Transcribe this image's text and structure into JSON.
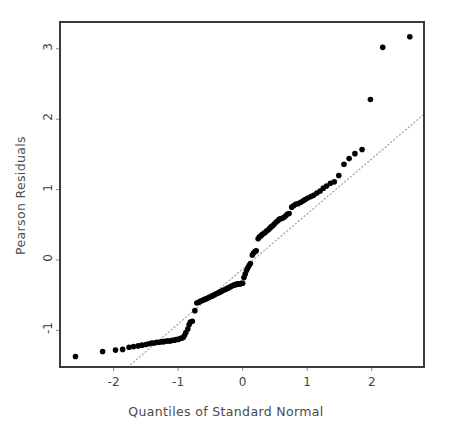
{
  "chart_data": {
    "type": "scatter",
    "title": "",
    "xlabel": "Quantiles of Standard Normal",
    "ylabel": "Pearson Residuals",
    "xlim": [
      -2.83,
      2.81
    ],
    "ylim": [
      -1.52,
      3.38
    ],
    "xticks": [
      -2,
      -1,
      0,
      1,
      2
    ],
    "xticklabels": [
      "-2",
      "-1",
      "0",
      "1",
      "2"
    ],
    "yticks": [
      -1,
      0,
      1,
      2,
      3
    ],
    "yticklabels": [
      "-1",
      "0",
      "1",
      "2",
      "3"
    ],
    "grid": false,
    "legend": null,
    "marker": {
      "shape": "circle",
      "color": "#000000",
      "size_px": 5.6
    },
    "reference_line": {
      "style": "dotted",
      "color": "#9a9a9a",
      "x": [
        -1.78,
        2.81
      ],
      "y": [
        -1.52,
        2.07
      ],
      "comment": "qq reference line through first and third quartiles"
    },
    "frame": {
      "color": "#3a3a3a",
      "width_px": 2
    },
    "n_points": 119,
    "points": [
      [
        -2.59,
        -1.37
      ],
      [
        -2.17,
        -1.3
      ],
      [
        -1.97,
        -1.28
      ],
      [
        -1.86,
        -1.27
      ],
      [
        -1.76,
        -1.24
      ],
      [
        -1.69,
        -1.23
      ],
      [
        -1.62,
        -1.22
      ],
      [
        -1.56,
        -1.21
      ],
      [
        -1.5,
        -1.2
      ],
      [
        -1.45,
        -1.19
      ],
      [
        -1.41,
        -1.18
      ],
      [
        -1.37,
        -1.18
      ],
      [
        -1.33,
        -1.17
      ],
      [
        -1.29,
        -1.17
      ],
      [
        -1.25,
        -1.16
      ],
      [
        -1.22,
        -1.16
      ],
      [
        -1.18,
        -1.15
      ],
      [
        -1.15,
        -1.15
      ],
      [
        -1.12,
        -1.15
      ],
      [
        -1.09,
        -1.14
      ],
      [
        -1.06,
        -1.14
      ],
      [
        -1.03,
        -1.13
      ],
      [
        -1.0,
        -1.13
      ],
      [
        -0.98,
        -1.12
      ],
      [
        -0.95,
        -1.11
      ],
      [
        -0.92,
        -1.1
      ],
      [
        -0.9,
        -1.07
      ],
      [
        -0.88,
        -1.03
      ],
      [
        -0.85,
        -0.98
      ],
      [
        -0.83,
        -0.92
      ],
      [
        -0.81,
        -0.88
      ],
      [
        -0.78,
        -0.87
      ],
      [
        -0.74,
        -0.72
      ],
      [
        -0.71,
        -0.61
      ],
      [
        -0.68,
        -0.6
      ],
      [
        -0.66,
        -0.59
      ],
      [
        -0.64,
        -0.58
      ],
      [
        -0.61,
        -0.57
      ],
      [
        -0.59,
        -0.56
      ],
      [
        -0.56,
        -0.55
      ],
      [
        -0.54,
        -0.54
      ],
      [
        -0.52,
        -0.53
      ],
      [
        -0.49,
        -0.52
      ],
      [
        -0.47,
        -0.51
      ],
      [
        -0.45,
        -0.5
      ],
      [
        -0.43,
        -0.49
      ],
      [
        -0.41,
        -0.48
      ],
      [
        -0.38,
        -0.47
      ],
      [
        -0.36,
        -0.46
      ],
      [
        -0.34,
        -0.45
      ],
      [
        -0.32,
        -0.44
      ],
      [
        -0.3,
        -0.43
      ],
      [
        -0.27,
        -0.42
      ],
      [
        -0.25,
        -0.41
      ],
      [
        -0.23,
        -0.4
      ],
      [
        -0.21,
        -0.39
      ],
      [
        -0.19,
        -0.38
      ],
      [
        -0.17,
        -0.37
      ],
      [
        -0.14,
        -0.36
      ],
      [
        -0.12,
        -0.35
      ],
      [
        -0.1,
        -0.35
      ],
      [
        -0.08,
        -0.34
      ],
      [
        -0.06,
        -0.34
      ],
      [
        -0.04,
        -0.34
      ],
      [
        -0.02,
        -0.33
      ],
      [
        0.0,
        -0.33
      ],
      [
        0.02,
        -0.25
      ],
      [
        0.04,
        -0.2
      ],
      [
        0.06,
        -0.15
      ],
      [
        0.08,
        -0.11
      ],
      [
        0.1,
        -0.08
      ],
      [
        0.12,
        -0.05
      ],
      [
        0.15,
        0.07
      ],
      [
        0.17,
        0.1
      ],
      [
        0.19,
        0.12
      ],
      [
        0.21,
        0.13
      ],
      [
        0.24,
        0.3
      ],
      [
        0.26,
        0.33
      ],
      [
        0.28,
        0.34
      ],
      [
        0.3,
        0.36
      ],
      [
        0.33,
        0.38
      ],
      [
        0.35,
        0.39
      ],
      [
        0.37,
        0.41
      ],
      [
        0.4,
        0.43
      ],
      [
        0.42,
        0.45
      ],
      [
        0.44,
        0.47
      ],
      [
        0.47,
        0.49
      ],
      [
        0.49,
        0.51
      ],
      [
        0.52,
        0.54
      ],
      [
        0.55,
        0.56
      ],
      [
        0.57,
        0.58
      ],
      [
        0.6,
        0.59
      ],
      [
        0.63,
        0.6
      ],
      [
        0.66,
        0.62
      ],
      [
        0.69,
        0.65
      ],
      [
        0.72,
        0.66
      ],
      [
        0.76,
        0.75
      ],
      [
        0.79,
        0.77
      ],
      [
        0.82,
        0.79
      ],
      [
        0.86,
        0.8
      ],
      [
        0.9,
        0.82
      ],
      [
        0.94,
        0.84
      ],
      [
        0.97,
        0.86
      ],
      [
        1.01,
        0.88
      ],
      [
        1.06,
        0.9
      ],
      [
        1.1,
        0.92
      ],
      [
        1.15,
        0.95
      ],
      [
        1.2,
        0.98
      ],
      [
        1.25,
        1.02
      ],
      [
        1.3,
        1.05
      ],
      [
        1.36,
        1.09
      ],
      [
        1.42,
        1.11
      ],
      [
        1.49,
        1.2
      ],
      [
        1.57,
        1.36
      ],
      [
        1.65,
        1.44
      ],
      [
        1.74,
        1.51
      ],
      [
        1.85,
        1.57
      ],
      [
        1.98,
        2.28
      ],
      [
        2.17,
        3.02
      ],
      [
        2.59,
        3.17
      ]
    ]
  },
  "labels": {
    "xlabel": "Quantiles of Standard Normal",
    "ylabel": "Pearson Residuals"
  },
  "xticks": [
    {
      "value": -2,
      "text": "-2"
    },
    {
      "value": -1,
      "text": "-1"
    },
    {
      "value": 0,
      "text": "0"
    },
    {
      "value": 1,
      "text": "1"
    },
    {
      "value": 2,
      "text": "2"
    }
  ],
  "yticks": [
    {
      "value": -1,
      "text": "-1"
    },
    {
      "value": 0,
      "text": "0"
    },
    {
      "value": 1,
      "text": "1"
    },
    {
      "value": 2,
      "text": "2"
    },
    {
      "value": 3,
      "text": "3"
    }
  ],
  "colors": {
    "marker": "#000000",
    "frame": "#3a3a3a",
    "reference_line": "#9a9a9a",
    "text": "#4a4a4a",
    "background": "#ffffff"
  }
}
